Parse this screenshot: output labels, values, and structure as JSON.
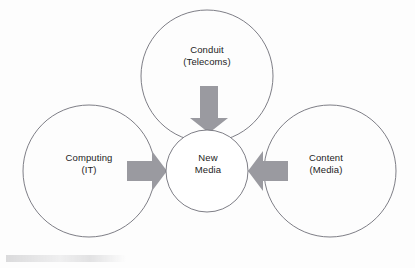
{
  "diagram": {
    "type": "venn-three-circle-with-center",
    "canvas": {
      "width": 415,
      "height": 268
    },
    "colors": {
      "background": "#fdfdfd",
      "circle_stroke": "#6f6f78",
      "circle_fill": "#ffffff",
      "arrow_fill": "#9a9aa0",
      "text": "#1c1c1c"
    },
    "circles": [
      {
        "id": "conduit",
        "name": "Conduit",
        "sublabel": "(Telecoms)",
        "position": "top",
        "cx": 207,
        "cy": 76,
        "r": 66
      },
      {
        "id": "computing",
        "name": "Computing",
        "sublabel": "(IT)",
        "position": "left",
        "cx": 89,
        "cy": 171,
        "r": 66
      },
      {
        "id": "content",
        "name": "Content",
        "sublabel": "(Media)",
        "position": "right",
        "cx": 330,
        "cy": 171,
        "r": 66
      }
    ],
    "center": {
      "id": "new-media",
      "line1": "New",
      "line2": "Media",
      "cx": 207,
      "cy": 171,
      "r": 41
    },
    "arrows": [
      {
        "id": "arrow-top",
        "from": "conduit",
        "to": "new-media",
        "direction": "down"
      },
      {
        "id": "arrow-left",
        "from": "computing",
        "to": "new-media",
        "direction": "right"
      },
      {
        "id": "arrow-right",
        "from": "content",
        "to": "new-media",
        "direction": "left"
      }
    ]
  }
}
